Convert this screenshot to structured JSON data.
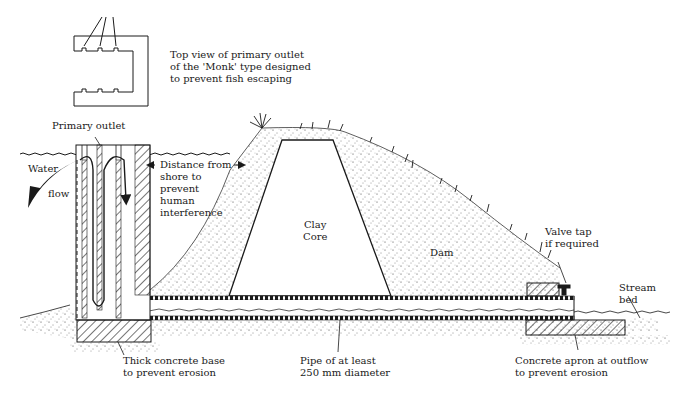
{
  "diagram": {
    "type": "cross-section",
    "labels": {
      "top_view": "Top view of primary outlet\nof the 'Monk' type designed\nto prevent fish escaping",
      "primary_outlet": "Primary outlet",
      "water": "Water",
      "flow": "flow",
      "distance": "Distance from\nshore to\nprevent\nhuman\ninterference",
      "clay_core": "Clay\nCore",
      "dam": "Dam",
      "valve_tap": "Valve tap\nif required",
      "stream_bed": "Stream\nbed",
      "concrete_base": "Thick concrete base\nto prevent erosion",
      "pipe": "Pipe of at least\n250 mm diameter",
      "concrete_apron": "Concrete apron at outflow\nto prevent erosion"
    },
    "colors": {
      "ink": "#1a1a1a",
      "background": "#ffffff"
    }
  }
}
